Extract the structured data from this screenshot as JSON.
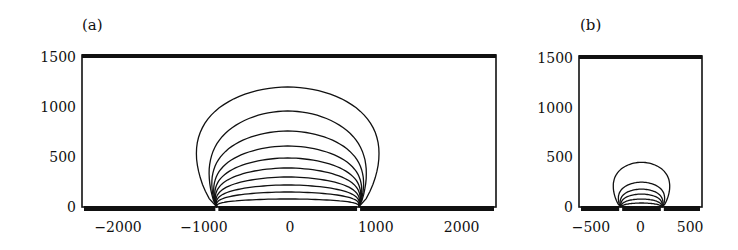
{
  "chart_data": [
    {
      "panel_label": "(a)",
      "type": "line",
      "description": "Equipotential contour lines between two surface electrodes",
      "xlabel": "",
      "ylabel": "",
      "xlim": [
        -2420,
        2400
      ],
      "ylim": [
        0,
        1500
      ],
      "xticks": [
        -2000,
        -1000,
        0,
        1000,
        2000
      ],
      "xtick_labels": [
        "−2000",
        "−1000",
        "0",
        "1000",
        "2000"
      ],
      "yticks": [
        0,
        500,
        1000,
        1500
      ],
      "ytick_labels": [
        "0",
        "500",
        "1000",
        "1500"
      ],
      "grid": false,
      "electrode_gaps_x": [
        -850,
        800
      ],
      "contours": [
        {
          "id": 1,
          "peak_y": 1200,
          "half_width": 1350
        },
        {
          "id": 2,
          "peak_y": 960,
          "half_width": 1060
        },
        {
          "id": 3,
          "peak_y": 760,
          "half_width": 990
        },
        {
          "id": 4,
          "peak_y": 610,
          "half_width": 940
        },
        {
          "id": 5,
          "peak_y": 490,
          "half_width": 910
        },
        {
          "id": 6,
          "peak_y": 390,
          "half_width": 890
        },
        {
          "id": 7,
          "peak_y": 300,
          "half_width": 870
        },
        {
          "id": 8,
          "peak_y": 220,
          "half_width": 860
        },
        {
          "id": 9,
          "peak_y": 150,
          "half_width": 850
        },
        {
          "id": 10,
          "peak_y": 80,
          "half_width": 840
        }
      ]
    },
    {
      "panel_label": "(b)",
      "type": "line",
      "description": "Equipotential contour lines between two closely spaced surface electrodes",
      "xlabel": "",
      "ylabel": "",
      "xlim": [
        -620,
        620
      ],
      "ylim": [
        0,
        1500
      ],
      "xticks": [
        -500,
        0,
        500
      ],
      "xtick_labels": [
        "−500",
        "0",
        "500"
      ],
      "yticks": [
        0,
        500,
        1000,
        1500
      ],
      "ytick_labels": [
        "0",
        "500",
        "1000",
        "1500"
      ],
      "grid": false,
      "electrode_gaps_x": [
        -200,
        220
      ],
      "contours": [
        {
          "id": 1,
          "peak_y": 450,
          "half_width": 370
        },
        {
          "id": 2,
          "peak_y": 250,
          "half_width": 270
        },
        {
          "id": 3,
          "peak_y": 180,
          "half_width": 230
        },
        {
          "id": 4,
          "peak_y": 130,
          "half_width": 210
        },
        {
          "id": 5,
          "peak_y": 80,
          "half_width": 195
        },
        {
          "id": 6,
          "peak_y": 40,
          "half_width": 180
        }
      ]
    }
  ]
}
